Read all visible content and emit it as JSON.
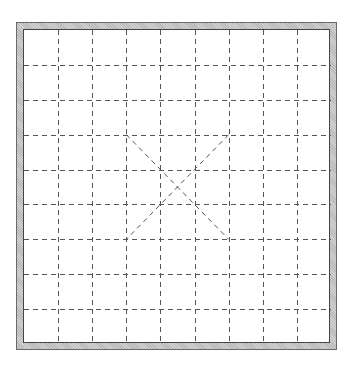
{
  "board": {
    "type": "grid-with-palace-diagonals",
    "columns": 9,
    "rows": 9,
    "line_style": "dashed",
    "colors": {
      "grid_line": "#555555",
      "frame_fill": "#c6c6c6",
      "frame_edge": "#444444",
      "background": "#ffffff"
    },
    "diagonals": {
      "from_col": 3,
      "to_col": 6,
      "from_row": 3,
      "to_row": 6
    }
  }
}
